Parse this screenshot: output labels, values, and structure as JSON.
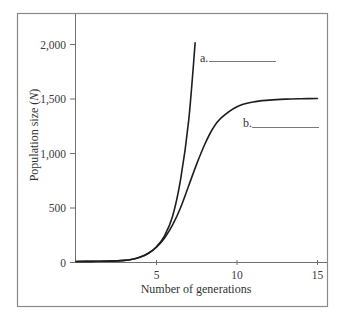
{
  "chart_data": {
    "type": "line",
    "title": "",
    "xlabel": "Number of generations",
    "ylabel_parts": {
      "prefix": "Population size (",
      "var": "N",
      "suffix": ")"
    },
    "ylabel": "Population size (N)",
    "xlim": [
      0,
      15.5
    ],
    "ylim": [
      0,
      2200
    ],
    "x_ticks": [
      5,
      10,
      15
    ],
    "x_tick_labels": [
      "5",
      "10",
      "15"
    ],
    "y_ticks": [
      0,
      500,
      1000,
      1500,
      2000
    ],
    "y_tick_labels": [
      "0",
      "500",
      "1,000",
      "1,500",
      "2,000"
    ],
    "grid": false,
    "legend": null,
    "series": [
      {
        "name": "a",
        "label": "a.",
        "description": "exponential growth (J-shaped)",
        "x": [
          0,
          1,
          2,
          3,
          3.5,
          4,
          4.5,
          5,
          5.5,
          6,
          6.5,
          7,
          7.4
        ],
        "y": [
          5,
          6,
          8,
          15,
          25,
          45,
          80,
          140,
          240,
          420,
          760,
          1300,
          2010
        ]
      },
      {
        "name": "b",
        "label": "b.",
        "description": "logistic growth (S-shaped), carrying capacity ~1,500",
        "x": [
          0,
          1,
          2,
          3,
          3.5,
          4,
          4.5,
          5,
          5.5,
          6,
          6.5,
          7,
          7.5,
          8,
          8.5,
          9,
          10,
          11,
          12,
          13,
          14,
          15
        ],
        "y": [
          5,
          6,
          8,
          15,
          25,
          45,
          80,
          135,
          220,
          340,
          500,
          700,
          900,
          1080,
          1225,
          1320,
          1425,
          1468,
          1485,
          1494,
          1498,
          1500
        ]
      }
    ],
    "annotations": [
      {
        "text": "a.",
        "blank": true,
        "near_series": "a"
      },
      {
        "text": "b.",
        "blank": true,
        "near_series": "b"
      }
    ]
  },
  "labels": {
    "a": "a.",
    "b": "b."
  }
}
